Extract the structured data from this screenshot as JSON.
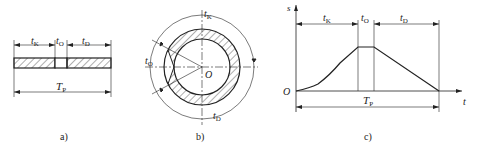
{
  "panels": [
    {
      "id": "a",
      "caption": "a)",
      "labels": {
        "tk": "t",
        "tk_sub": "K",
        "to": "t",
        "to_sub": "O",
        "td": "t",
        "td_sub": "D",
        "tp": "T",
        "tp_sub": "P"
      }
    },
    {
      "id": "b",
      "caption": "b)",
      "labels": {
        "tk": "t",
        "tk_sub": "K",
        "to": "t",
        "to_sub": "O",
        "td": "t",
        "td_sub": "D",
        "center": "O"
      }
    },
    {
      "id": "c",
      "caption": "c)",
      "labels": {
        "y_axis": "s",
        "x_axis": "t",
        "origin": "O",
        "tk": "t",
        "tk_sub": "K",
        "to": "t",
        "to_sub": "O",
        "td": "t",
        "td_sub": "D",
        "tp": "T",
        "tp_sub": "P"
      }
    }
  ],
  "colors": {
    "line": "#222222",
    "background": "#ffffff"
  }
}
